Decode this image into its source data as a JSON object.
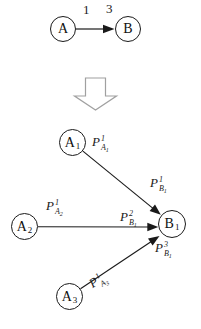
{
  "figure": {
    "colors": {
      "background": "#ffffff",
      "line": "#1a1a1a",
      "block_arrow_outline": "#a0a0a0",
      "block_arrow_fill": "#ffffff"
    },
    "top": {
      "node_a": {
        "label": "A"
      },
      "node_b": {
        "label": "B"
      },
      "weight_left": "1",
      "weight_right": "3"
    },
    "transform_icon": "down-block-arrow",
    "bottom": {
      "nodes": {
        "a1": {
          "base": "A",
          "sub": "1"
        },
        "a2": {
          "base": "A",
          "sub": "2"
        },
        "a3": {
          "base": "A",
          "sub": "3"
        },
        "b1": {
          "base": "B",
          "sub": "1"
        }
      },
      "edge_labels": {
        "pa1": {
          "base": "P",
          "sup": "1",
          "sub": "A",
          "subsub": "1"
        },
        "pb1": {
          "base": "P",
          "sup": "1",
          "sub": "B",
          "subsub": "1"
        },
        "pa2": {
          "base": "P",
          "sup": "1",
          "sub": "A",
          "subsub": "2"
        },
        "pb2": {
          "base": "P",
          "sup": "2",
          "sub": "B",
          "subsub": "1"
        },
        "pb3": {
          "base": "P",
          "sup": "3",
          "sub": "B",
          "subsub": "1"
        },
        "pa3": {
          "base": "P",
          "sup": "1",
          "sub": "A",
          "subsub": "3"
        }
      }
    }
  }
}
